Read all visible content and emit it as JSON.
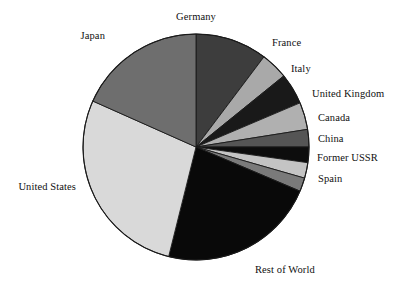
{
  "chart_data": {
    "type": "pie",
    "title": "",
    "subtitle": "",
    "xlabel": "",
    "ylabel": "",
    "legend_position": "none",
    "grid": false,
    "labels_outside": true,
    "start_angle_deg": 0,
    "direction": "clockwise",
    "categories": [
      "Germany",
      "France",
      "Italy",
      "United Kingdom",
      "Canada",
      "China",
      "Former USSR",
      "Spain",
      "Rest of World",
      "United States",
      "Japan"
    ],
    "values": [
      10.3,
      3.9,
      4.4,
      3.9,
      2.5,
      2.2,
      2.2,
      1.9,
      22.5,
      27.8,
      18.4
    ],
    "slice_angles_deg": [
      37.0,
      14.0,
      16.0,
      14.0,
      9.0,
      8.0,
      8.0,
      7.0,
      81.0,
      100.0,
      66.0
    ],
    "slice_colors": [
      "#3d3d3d",
      "#a9a9a9",
      "#191919",
      "#b0b0b0",
      "#555555",
      "#0d0d0d",
      "#c4c4c4",
      "#7a7a7a",
      "#090909",
      "#d9d9d9",
      "#6e6e6e"
    ],
    "outline_color": "#1a1a1a",
    "background_color": "#ffffff"
  },
  "geometry": {
    "center_x": 196,
    "center_y": 147,
    "radius": 113
  },
  "labels": [
    {
      "text": "Germany",
      "x": 196,
      "y": 12,
      "anchor": "center"
    },
    {
      "text": "France",
      "x": 272,
      "y": 38,
      "anchor": "right"
    },
    {
      "text": "Italy",
      "x": 291,
      "y": 64,
      "anchor": "right"
    },
    {
      "text": "United Kingdom",
      "x": 312,
      "y": 89,
      "anchor": "right"
    },
    {
      "text": "Canada",
      "x": 318,
      "y": 113,
      "anchor": "right"
    },
    {
      "text": "China",
      "x": 318,
      "y": 134,
      "anchor": "right"
    },
    {
      "text": "Former USSR",
      "x": 317,
      "y": 153,
      "anchor": "right"
    },
    {
      "text": "Spain",
      "x": 318,
      "y": 174,
      "anchor": "right"
    },
    {
      "text": "Rest of World",
      "x": 255,
      "y": 265,
      "anchor": "right"
    },
    {
      "text": "United States",
      "x": 76,
      "y": 182,
      "anchor": "left"
    },
    {
      "text": "Japan",
      "x": 105,
      "y": 31,
      "anchor": "left"
    }
  ]
}
